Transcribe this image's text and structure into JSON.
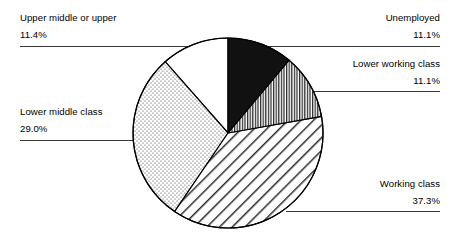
{
  "chart_data": {
    "type": "pie",
    "title": "",
    "subtitle": "",
    "xlabel": "",
    "ylabel": "",
    "legend_position": "none",
    "grid": false,
    "units": "percent",
    "total": 99.9,
    "start_angle_deg": 0,
    "direction": "clockwise",
    "categories": [
      "Unemployed",
      "Lower working class",
      "Working class",
      "Lower middle class",
      "Upper middle or upper"
    ],
    "values": [
      11.1,
      11.1,
      37.3,
      29.0,
      11.4
    ],
    "value_labels": [
      "11.1%",
      "11.1%",
      "37.3%",
      "29.0%",
      "11.4%"
    ],
    "slices": [
      {
        "label": "Unemployed",
        "value": 11.1,
        "value_label": "11.1%",
        "pattern": "solid-black",
        "fill": "#111111",
        "stroke": "#000000",
        "start_deg": 0.0,
        "end_deg": 39.96
      },
      {
        "label": "Lower working class",
        "value": 11.1,
        "value_label": "11.1%",
        "pattern": "vertical-lines",
        "fill": "#ffffff",
        "stroke": "#000000",
        "start_deg": 39.96,
        "end_deg": 79.92
      },
      {
        "label": "Working class",
        "value": 37.3,
        "value_label": "37.3%",
        "pattern": "diagonal-hatch",
        "fill": "#ffffff",
        "stroke": "#000000",
        "start_deg": 79.92,
        "end_deg": 214.2
      },
      {
        "label": "Lower middle class",
        "value": 29.0,
        "value_label": "29.0%",
        "pattern": "dotted-stipple",
        "fill": "#ffffff",
        "stroke": "#000000",
        "start_deg": 214.2,
        "end_deg": 318.6
      },
      {
        "label": "Upper middle or upper",
        "value": 11.4,
        "value_label": "11.4%",
        "pattern": "none-white",
        "fill": "#ffffff",
        "stroke": "#000000",
        "start_deg": 318.6,
        "end_deg": 360.0
      }
    ]
  },
  "labels": {
    "upper_middle": {
      "category": "Upper middle or upper",
      "value": "11.4%"
    },
    "lower_middle": {
      "category": "Lower middle class",
      "value": "29.0%"
    },
    "unemployed": {
      "category": "Unemployed",
      "value": "11.1%"
    },
    "lower_working": {
      "category": "Lower working class",
      "value": "11.1%"
    },
    "working": {
      "category": "Working class",
      "value": "37.3%"
    }
  },
  "colors": {
    "background": "#ffffff",
    "outline": "#000000",
    "text": "#000000",
    "leader_line": "#3a3a3a",
    "slice_black": "#111111"
  }
}
